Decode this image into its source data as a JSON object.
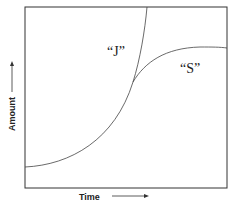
{
  "diagram": {
    "curves": [
      {
        "name": "J-curve",
        "label": "“J”"
      },
      {
        "name": "S-curve",
        "label": "“S”"
      }
    ],
    "axes": {
      "x_label": "Time",
      "y_label": "Amount"
    }
  }
}
